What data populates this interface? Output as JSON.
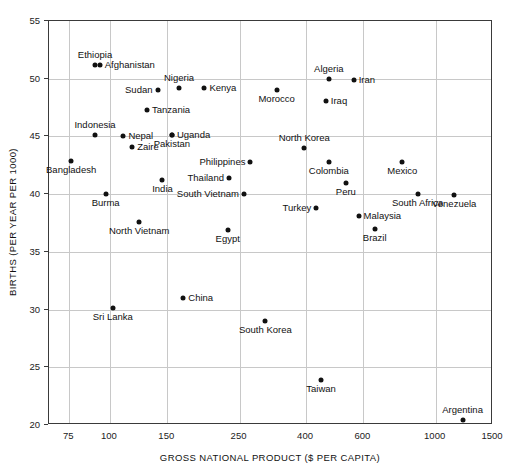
{
  "chart_data": {
    "type": "scatter",
    "title": "",
    "xlabel": "GROSS NATIONAL PRODUCT ($ PER CAPITA)",
    "ylabel": "BIRTHS (PER YEAR PER 1000)",
    "xscale": "log",
    "yscale": "linear",
    "xlim": [
      65,
      1500
    ],
    "ylim": [
      20,
      55
    ],
    "xticks": [
      75,
      100,
      150,
      250,
      400,
      600,
      1000,
      1500
    ],
    "xticklabels": [
      "75",
      "100",
      "150",
      "250",
      "400",
      "600",
      "1000",
      "1500"
    ],
    "yticks": [
      20,
      25,
      30,
      35,
      40,
      45,
      50,
      55
    ],
    "yticklabels": [
      "20",
      "25",
      "30",
      "35",
      "40",
      "45",
      "50",
      "55"
    ],
    "grid": true,
    "legend": "none",
    "points": [
      {
        "label": "Ethiopia",
        "x": 90,
        "y": 51.2,
        "pos": "a"
      },
      {
        "label": "Afghanistan",
        "x": 93,
        "y": 51.2,
        "pos": "r"
      },
      {
        "label": "Sudan",
        "x": 140,
        "y": 49.0,
        "pos": "l"
      },
      {
        "label": "Nigeria",
        "x": 163,
        "y": 49.2,
        "pos": "a"
      },
      {
        "label": "Kenya",
        "x": 195,
        "y": 49.2,
        "pos": "r"
      },
      {
        "label": "Morocco",
        "x": 325,
        "y": 49.0,
        "pos": "b"
      },
      {
        "label": "Algeria",
        "x": 470,
        "y": 50.0,
        "pos": "a"
      },
      {
        "label": "Iran",
        "x": 560,
        "y": 49.9,
        "pos": "r"
      },
      {
        "label": "Iraq",
        "x": 460,
        "y": 48.1,
        "pos": "r"
      },
      {
        "label": "Tanzania",
        "x": 130,
        "y": 47.3,
        "pos": "r"
      },
      {
        "label": "Indonesia",
        "x": 90,
        "y": 45.1,
        "pos": "a"
      },
      {
        "label": "Nepal",
        "x": 110,
        "y": 45.0,
        "pos": "r"
      },
      {
        "label": "Uganda",
        "x": 155,
        "y": 45.1,
        "pos": "r"
      },
      {
        "label": "Pakistan",
        "x": 155,
        "y": 45.1,
        "pos": "b"
      },
      {
        "label": "Zaire",
        "x": 117,
        "y": 44.1,
        "pos": "r"
      },
      {
        "label": "North Korea",
        "x": 395,
        "y": 44.0,
        "pos": "a"
      },
      {
        "label": "Bangladesh",
        "x": 76,
        "y": 42.9,
        "pos": "b"
      },
      {
        "label": "Philippines",
        "x": 270,
        "y": 42.8,
        "pos": "l"
      },
      {
        "label": "Colombia",
        "x": 470,
        "y": 42.8,
        "pos": "b"
      },
      {
        "label": "Mexico",
        "x": 790,
        "y": 42.8,
        "pos": "b"
      },
      {
        "label": "Thailand",
        "x": 232,
        "y": 41.4,
        "pos": "l"
      },
      {
        "label": "India",
        "x": 145,
        "y": 41.2,
        "pos": "b"
      },
      {
        "label": "Peru",
        "x": 530,
        "y": 41.0,
        "pos": "b"
      },
      {
        "label": "Burma",
        "x": 97,
        "y": 40.0,
        "pos": "b"
      },
      {
        "label": "South Vietnam",
        "x": 258,
        "y": 40.0,
        "pos": "l"
      },
      {
        "label": "South Africa",
        "x": 880,
        "y": 40.0,
        "pos": "b"
      },
      {
        "label": "Venezuela",
        "x": 1140,
        "y": 39.9,
        "pos": "b"
      },
      {
        "label": "Turkey",
        "x": 430,
        "y": 38.8,
        "pos": "l"
      },
      {
        "label": "Malaysia",
        "x": 580,
        "y": 38.1,
        "pos": "r"
      },
      {
        "label": "North Vietnam",
        "x": 123,
        "y": 37.6,
        "pos": "b"
      },
      {
        "label": "Brazil",
        "x": 650,
        "y": 37.0,
        "pos": "b"
      },
      {
        "label": "Egypt",
        "x": 230,
        "y": 36.9,
        "pos": "b"
      },
      {
        "label": "China",
        "x": 168,
        "y": 31.0,
        "pos": "r"
      },
      {
        "label": "Sri Lanka",
        "x": 102,
        "y": 30.1,
        "pos": "b"
      },
      {
        "label": "South Korea",
        "x": 300,
        "y": 29.0,
        "pos": "b"
      },
      {
        "label": "Taiwan",
        "x": 445,
        "y": 23.9,
        "pos": "b"
      },
      {
        "label": "Argentina",
        "x": 1210,
        "y": 20.4,
        "pos": "a"
      }
    ]
  }
}
